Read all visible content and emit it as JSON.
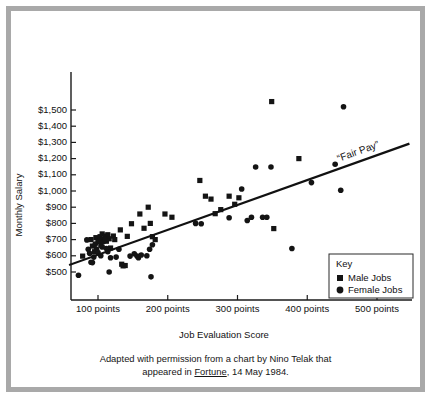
{
  "figure": {
    "caption_line1": "Adapted with permission from a chart by Nino Telak that",
    "caption_line2_pre": "appeared in ",
    "caption_source": "Fortune",
    "caption_line2_post": ", 14 May 1984."
  },
  "legend": {
    "title": "Key",
    "male_label": "Male Jobs",
    "female_label": "Female Jobs",
    "male_marker": "square-marker",
    "female_marker": "circle-marker"
  },
  "annotations": {
    "trendline_label": "“Fair Pay”"
  },
  "colors": {
    "ink": "#141414",
    "frame": "#a9a9a9",
    "paper": "#ffffff"
  },
  "chart_data": {
    "type": "scatter",
    "title": "",
    "xlabel": "Job Evaluation Score",
    "ylabel": "Monthly Salary",
    "xlim": [
      55,
      560
    ],
    "ylim": [
      430,
      1580
    ],
    "grid": false,
    "legend_position": "bottom-right",
    "xticks": [
      100,
      200,
      300,
      400,
      500
    ],
    "xticklabels": [
      "100 points",
      "200 points",
      "300 points",
      "400 points",
      "500 points"
    ],
    "yticks": [
      500,
      600,
      700,
      800,
      900,
      1000,
      1100,
      1200,
      1300,
      1400,
      1500
    ],
    "yticklabels": [
      "$500",
      "$600",
      "$700",
      "$800",
      "$900",
      "$1,000",
      "$1,100",
      "$1,200",
      "$1,300",
      "$1,400",
      "$1,500"
    ],
    "annotation_line": {
      "name": "Fair Pay",
      "label": "“Fair Pay”",
      "x0": 60,
      "y0": 545,
      "x1": 545,
      "y1": 1290
    },
    "series": [
      {
        "name": "Male Jobs",
        "marker": "square",
        "color": "#141414",
        "points": [
          [
            78,
            598
          ],
          [
            90,
            700
          ],
          [
            92,
            660
          ],
          [
            95,
            625
          ],
          [
            97,
            712
          ],
          [
            100,
            690
          ],
          [
            103,
            718
          ],
          [
            104,
            665
          ],
          [
            106,
            735
          ],
          [
            108,
            700
          ],
          [
            110,
            722
          ],
          [
            112,
            690
          ],
          [
            114,
            730
          ],
          [
            116,
            705
          ],
          [
            118,
            648
          ],
          [
            122,
            722
          ],
          [
            124,
            700
          ],
          [
            132,
            760
          ],
          [
            134,
            548
          ],
          [
            136,
            538
          ],
          [
            139,
            540
          ],
          [
            142,
            720
          ],
          [
            148,
            798
          ],
          [
            160,
            858
          ],
          [
            166,
            770
          ],
          [
            172,
            900
          ],
          [
            175,
            800
          ],
          [
            178,
            718
          ],
          [
            182,
            700
          ],
          [
            196,
            858
          ],
          [
            206,
            838
          ],
          [
            246,
            1065
          ],
          [
            254,
            968
          ],
          [
            262,
            950
          ],
          [
            268,
            860
          ],
          [
            276,
            885
          ],
          [
            288,
            968
          ],
          [
            296,
            918
          ],
          [
            302,
            958
          ],
          [
            388,
            1200
          ],
          [
            352,
            768
          ],
          [
            349,
            1552
          ]
        ]
      },
      {
        "name": "Female Jobs",
        "marker": "circle",
        "color": "#141414",
        "points": [
          [
            72,
            480
          ],
          [
            84,
            698
          ],
          [
            86,
            640
          ],
          [
            88,
            615
          ],
          [
            90,
            560
          ],
          [
            92,
            558
          ],
          [
            94,
            592
          ],
          [
            96,
            672
          ],
          [
            98,
            640
          ],
          [
            100,
            620
          ],
          [
            102,
            690
          ],
          [
            104,
            600
          ],
          [
            106,
            655
          ],
          [
            108,
            688
          ],
          [
            110,
            700
          ],
          [
            112,
            645
          ],
          [
            114,
            625
          ],
          [
            116,
            500
          ],
          [
            118,
            588
          ],
          [
            126,
            592
          ],
          [
            130,
            640
          ],
          [
            146,
            598
          ],
          [
            152,
            612
          ],
          [
            156,
            598
          ],
          [
            158,
            588
          ],
          [
            162,
            605
          ],
          [
            170,
            600
          ],
          [
            174,
            640
          ],
          [
            176,
            470
          ],
          [
            178,
            668
          ],
          [
            240,
            800
          ],
          [
            248,
            798
          ],
          [
            288,
            835
          ],
          [
            306,
            1012
          ],
          [
            314,
            818
          ],
          [
            320,
            838
          ],
          [
            336,
            838
          ],
          [
            342,
            838
          ],
          [
            326,
            1148
          ],
          [
            348,
            1148
          ],
          [
            378,
            645
          ],
          [
            406,
            1052
          ],
          [
            440,
            1165
          ],
          [
            452,
            1520
          ],
          [
            448,
            1005
          ]
        ]
      }
    ]
  }
}
